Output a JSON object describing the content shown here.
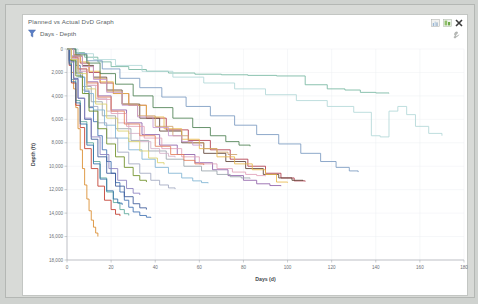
{
  "window": {
    "title": "Planned vs Actual DvD Graph",
    "filter_label": "Days - Depth",
    "filter_icon": "funnel-icon",
    "controls": [
      {
        "name": "chart-view-icon",
        "label": "Chart view"
      },
      {
        "name": "grid-view-icon",
        "label": "Grid view"
      },
      {
        "name": "close-icon",
        "label": "Close"
      }
    ],
    "tool_button": {
      "name": "settings-wrench-icon",
      "label": "Settings"
    }
  },
  "chart_data": {
    "type": "line",
    "title": "Planned vs Actual DvD Graph",
    "xlabel": "Days (d)",
    "ylabel": "Depth (ft)",
    "xlim": [
      0,
      180
    ],
    "ylim": [
      0,
      18000
    ],
    "y_inverted": true,
    "grid": true,
    "legend": "none",
    "xticks": [
      0,
      20,
      40,
      60,
      80,
      100,
      120,
      140,
      160,
      180
    ],
    "xtick_labels": [
      "0",
      "20",
      "40",
      "60",
      "80",
      "100",
      "120",
      "140",
      "160",
      "180"
    ],
    "yticks": [
      0,
      2000,
      4000,
      6000,
      8000,
      10000,
      12000,
      14000,
      16000,
      18000
    ],
    "ytick_labels": [
      "0",
      "2,000",
      "4,000",
      "6,000",
      "8,000",
      "10,000",
      "12,000",
      "14,000",
      "16,000",
      "18,000"
    ],
    "series": [
      {
        "name": "Well 01",
        "color": "#3d6fb0",
        "x": [
          0,
          2,
          4,
          6,
          8,
          10,
          12,
          14,
          16,
          18,
          20,
          22,
          24,
          26,
          28,
          30,
          33,
          36,
          38
        ],
        "y": [
          0,
          600,
          1400,
          2400,
          3600,
          5000,
          6200,
          7400,
          8600,
          9600,
          10600,
          11400,
          12200,
          12900,
          13500,
          13900,
          14200,
          14350,
          14400
        ]
      },
      {
        "name": "Well 02",
        "color": "#d98a2b",
        "x": [
          0,
          1,
          2,
          3,
          4,
          5,
          6,
          7,
          8,
          9,
          10,
          11,
          12,
          13,
          14
        ],
        "y": [
          0,
          900,
          2000,
          3400,
          5000,
          6800,
          8600,
          10200,
          11600,
          12800,
          13800,
          14600,
          15200,
          15700,
          16000
        ]
      },
      {
        "name": "Well 03",
        "color": "#76b7a0",
        "x": [
          0,
          4,
          8,
          14,
          20,
          28,
          36,
          46,
          58,
          70,
          82,
          95,
          108,
          118,
          126,
          133,
          140,
          146
        ],
        "y": [
          0,
          300,
          700,
          1100,
          1500,
          1750,
          1900,
          2050,
          2150,
          2200,
          2250,
          2300,
          3050,
          3400,
          3500,
          3700,
          3750,
          3780
        ]
      },
      {
        "name": "Well 04",
        "color": "#b03a4a",
        "x": [
          0,
          3,
          6,
          10,
          15,
          21,
          28,
          36,
          45,
          55,
          65,
          74,
          82,
          90,
          97,
          103,
          108
        ],
        "y": [
          0,
          500,
          1200,
          2000,
          2900,
          3800,
          4800,
          5900,
          6900,
          7800,
          8600,
          9400,
          10000,
          10600,
          11000,
          11250,
          11300
        ]
      },
      {
        "name": "Well 05",
        "color": "#8e5fa8",
        "x": [
          0,
          2,
          5,
          9,
          14,
          20,
          27,
          34,
          42,
          50,
          58,
          66,
          73,
          80,
          86,
          92,
          97
        ],
        "y": [
          0,
          700,
          1700,
          2800,
          4000,
          5200,
          6300,
          7300,
          8200,
          9000,
          9700,
          10300,
          10800,
          11200,
          11500,
          11650,
          11700
        ]
      },
      {
        "name": "Well 06",
        "color": "#5c4033",
        "x": [
          0,
          3,
          7,
          12,
          18,
          25,
          33,
          42,
          52,
          62,
          72,
          81,
          89,
          96,
          102,
          107
        ],
        "y": [
          0,
          600,
          1400,
          2400,
          3500,
          4700,
          5900,
          7000,
          8000,
          8900,
          9600,
          10200,
          10700,
          11000,
          11200,
          11250
        ]
      },
      {
        "name": "Well 07",
        "color": "#e0a0b8",
        "x": [
          0,
          2,
          5,
          9,
          14,
          20,
          27,
          35,
          43,
          52,
          60,
          68,
          75,
          81,
          86,
          90
        ],
        "y": [
          0,
          800,
          1900,
          3100,
          4300,
          5500,
          6600,
          7600,
          8500,
          9200,
          9800,
          10200,
          10500,
          10700,
          10800,
          10850
        ]
      },
      {
        "name": "Well 08",
        "color": "#9aa4ab",
        "x": [
          0,
          2,
          4,
          7,
          11,
          16,
          22,
          29,
          37,
          45,
          53,
          61,
          68,
          74,
          79,
          83
        ],
        "y": [
          0,
          900,
          2000,
          3200,
          4500,
          5700,
          6800,
          7800,
          8700,
          9400,
          10000,
          10400,
          10700,
          10900,
          11000,
          11050
        ]
      },
      {
        "name": "Well 09",
        "color": "#7fb3d3",
        "x": [
          0,
          2,
          5,
          8,
          12,
          17,
          22,
          28,
          34,
          40,
          46,
          52,
          57,
          61,
          64
        ],
        "y": [
          0,
          1100,
          2400,
          3800,
          5200,
          6500,
          7600,
          8600,
          9400,
          10100,
          10600,
          11000,
          11250,
          11400,
          11450
        ]
      },
      {
        "name": "Well 10",
        "color": "#e8b84a",
        "x": [
          0,
          3,
          6,
          10,
          15,
          21,
          28,
          36,
          44,
          52,
          60,
          68,
          76,
          84,
          90,
          95,
          100
        ],
        "y": [
          0,
          500,
          1100,
          1900,
          2800,
          3800,
          4800,
          5800,
          6800,
          7700,
          8500,
          9200,
          9800,
          10300,
          10700,
          11350,
          11400
        ]
      },
      {
        "name": "Well 11",
        "color": "#5aa89a",
        "x": [
          0,
          1,
          2,
          4,
          6,
          9,
          12,
          15,
          18,
          21,
          24,
          26,
          28
        ],
        "y": [
          0,
          1200,
          2600,
          4400,
          6200,
          8000,
          9600,
          11000,
          12200,
          13100,
          13700,
          14050,
          14200
        ]
      },
      {
        "name": "Well 12",
        "color": "#c0392b",
        "x": [
          0,
          1,
          2,
          4,
          6,
          8,
          11,
          14,
          17,
          20,
          22,
          24
        ],
        "y": [
          0,
          1400,
          2900,
          4800,
          6700,
          8500,
          10200,
          11700,
          12900,
          13700,
          14100,
          14250
        ]
      },
      {
        "name": "Well 13",
        "color": "#3b5998",
        "x": [
          0,
          1,
          3,
          5,
          8,
          11,
          14,
          18,
          22,
          26,
          30,
          33,
          36
        ],
        "y": [
          0,
          1000,
          2500,
          4200,
          6000,
          7700,
          9200,
          10600,
          11700,
          12600,
          13200,
          13550,
          13700
        ]
      },
      {
        "name": "Well 14",
        "color": "#a0a8c0",
        "x": [
          0,
          2,
          4,
          7,
          10,
          14,
          18,
          23,
          28,
          33,
          38,
          42,
          46,
          49
        ],
        "y": [
          0,
          900,
          2100,
          3500,
          4900,
          6300,
          7600,
          8800,
          9800,
          10600,
          11200,
          11600,
          11850,
          11950
        ]
      },
      {
        "name": "Well 15",
        "color": "#cfa26b",
        "x": [
          0,
          3,
          7,
          12,
          18,
          25,
          32,
          40,
          48,
          55,
          62,
          68,
          73,
          77
        ],
        "y": [
          0,
          600,
          1500,
          2500,
          3600,
          4700,
          5700,
          6600,
          7400,
          8000,
          8500,
          8800,
          9000,
          9050
        ]
      },
      {
        "name": "Well 16",
        "color": "#6b8e23",
        "x": [
          0,
          2,
          4,
          7,
          10,
          14,
          18,
          22,
          26,
          30,
          33,
          36
        ],
        "y": [
          0,
          1000,
          2300,
          3800,
          5300,
          6800,
          8100,
          9200,
          10100,
          10800,
          11200,
          11350
        ]
      },
      {
        "name": "Well 17",
        "color": "#b2d8d8",
        "x": [
          0,
          5,
          12,
          22,
          34,
          48,
          62,
          76,
          90,
          104,
          118,
          130,
          138,
          142,
          146,
          150,
          154,
          158,
          164,
          170
        ],
        "y": [
          0,
          400,
          900,
          1400,
          1900,
          2400,
          2900,
          3400,
          3900,
          4400,
          4900,
          5400,
          7400,
          7500,
          5300,
          4900,
          5600,
          6600,
          7200,
          7400
        ]
      },
      {
        "name": "Well 18",
        "color": "#d4b0c8",
        "x": [
          0,
          2,
          5,
          9,
          13,
          18,
          23,
          28,
          33,
          38,
          42,
          46,
          49
        ],
        "y": [
          0,
          800,
          1900,
          3100,
          4200,
          5300,
          6300,
          7200,
          7900,
          8500,
          8900,
          9150,
          9250
        ]
      },
      {
        "name": "Well 19",
        "color": "#7a9ac0",
        "x": [
          0,
          4,
          9,
          16,
          24,
          33,
          43,
          54,
          65,
          76,
          86,
          96,
          106,
          115,
          122,
          128,
          132
        ],
        "y": [
          0,
          400,
          1000,
          1700,
          2500,
          3300,
          4100,
          4900,
          5700,
          6500,
          7300,
          8100,
          8900,
          9600,
          10100,
          10400,
          10500
        ]
      },
      {
        "name": "Well 20",
        "color": "#e57f5c",
        "x": [
          0,
          2,
          5,
          9,
          14,
          20,
          26,
          33,
          40,
          47,
          53,
          58,
          62
        ],
        "y": [
          0,
          700,
          1700,
          2900,
          4100,
          5300,
          6400,
          7400,
          8300,
          9000,
          9500,
          9800,
          9900
        ]
      },
      {
        "name": "Well 21",
        "color": "#8a7fbf",
        "x": [
          0,
          1,
          3,
          5,
          8,
          11,
          15,
          19,
          23,
          27,
          30,
          33
        ],
        "y": [
          0,
          1100,
          2600,
          4200,
          5900,
          7500,
          9000,
          10200,
          11200,
          11900,
          12300,
          12450
        ]
      },
      {
        "name": "Well 22",
        "color": "#4b7f52",
        "x": [
          0,
          4,
          9,
          15,
          22,
          30,
          39,
          48,
          57,
          65,
          72,
          78,
          83
        ],
        "y": [
          0,
          500,
          1200,
          2100,
          3000,
          4000,
          5000,
          5900,
          6700,
          7400,
          7900,
          8200,
          8300
        ]
      },
      {
        "name": "Well 23",
        "color": "#c89ad0",
        "x": [
          0,
          3,
          7,
          12,
          18,
          25,
          32,
          39,
          46,
          52,
          57,
          61
        ],
        "y": [
          0,
          600,
          1500,
          2600,
          3700,
          4800,
          5800,
          6700,
          7400,
          7900,
          8200,
          8300
        ]
      },
      {
        "name": "Well 24",
        "color": "#2f6fa8",
        "x": [
          0,
          1,
          2,
          4,
          6,
          9,
          12,
          15,
          18,
          21,
          23,
          25
        ],
        "y": [
          0,
          1300,
          2800,
          4600,
          6400,
          8200,
          9800,
          11100,
          12100,
          12800,
          13150,
          13300
        ]
      },
      {
        "name": "Well 25",
        "color": "#d9d06a",
        "x": [
          0,
          2,
          5,
          9,
          13,
          18,
          23,
          28,
          33,
          37,
          41,
          44
        ],
        "y": [
          0,
          900,
          2100,
          3400,
          4700,
          5900,
          7000,
          7900,
          8700,
          9300,
          9700,
          9850
        ]
      }
    ]
  }
}
